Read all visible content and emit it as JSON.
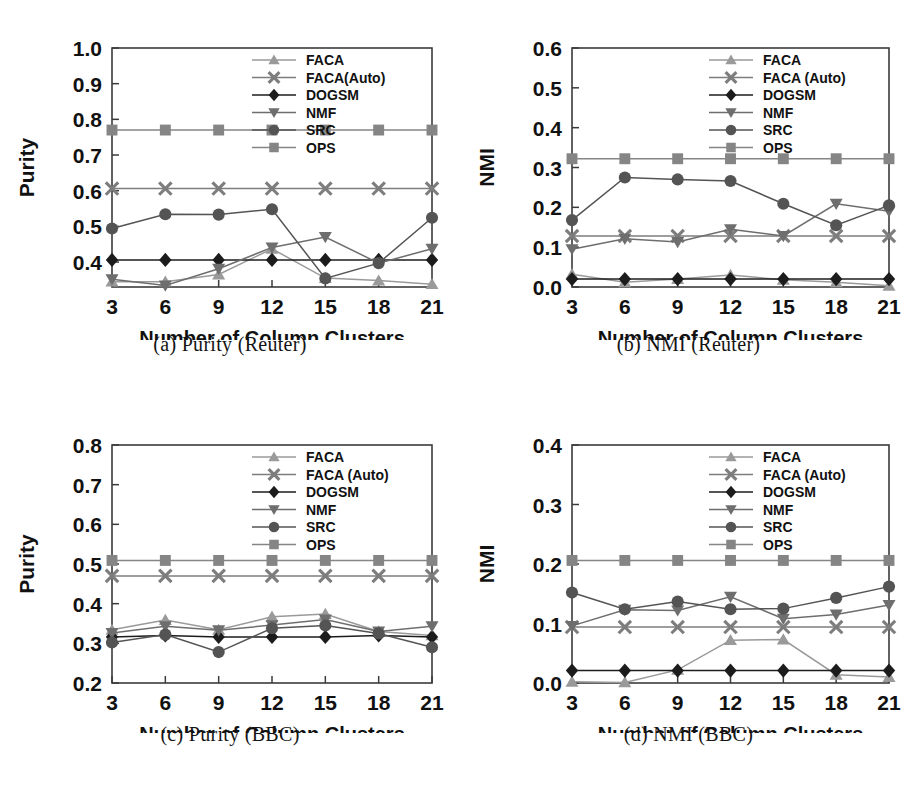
{
  "figure": {
    "x_axis_title": "Number of Column Clusters",
    "x_ticks": [
      "3",
      "6",
      "9",
      "12",
      "15",
      "18",
      "21"
    ],
    "series_names": [
      "FACA",
      "FACA (Auto)",
      "DOGSM",
      "NMF",
      "SRC",
      "OPS"
    ],
    "series_markers": [
      "triangle-up-marker",
      "cross-x-marker",
      "diamond-marker",
      "triangle-down-marker",
      "circle-marker",
      "square-marker"
    ],
    "series_colors": [
      "#9a9a9a",
      "#7d7d7d",
      "#1c1c1c",
      "#6e6e6e",
      "#545454",
      "#858585"
    ]
  },
  "panels": [
    {
      "id": "panel-a",
      "caption": "(a) Purity (Reuter)",
      "ylabel": "Purity",
      "y_ticks": [
        "1.0",
        "0.9",
        "0.8",
        "0.7",
        "0.6",
        "0.5",
        "0.4"
      ],
      "legend_labels": [
        "FACA",
        "FACA(Auto)",
        "DOGSM",
        "NMF",
        "SRC",
        "OPS"
      ],
      "chart_data": {
        "type": "line",
        "title": "(a) Purity (Reuter)",
        "xlabel": "Number of Column Clusters",
        "ylabel": "Purity",
        "x": [
          3,
          6,
          9,
          12,
          15,
          18,
          21
        ],
        "xlim": [
          3,
          21
        ],
        "ylim": [
          0.33,
          1.0
        ],
        "ytick_values": [
          1.0,
          0.9,
          0.8,
          0.7,
          0.6,
          0.5,
          0.4
        ],
        "grid": false,
        "legend_position": "top-right",
        "series": [
          {
            "name": "FACA",
            "values": [
              0.345,
              0.345,
              0.365,
              0.437,
              0.355,
              0.348,
              0.338
            ]
          },
          {
            "name": "FACA(Auto)",
            "values": [
              0.606,
              0.606,
              0.606,
              0.606,
              0.606,
              0.606,
              0.606
            ]
          },
          {
            "name": "DOGSM",
            "values": [
              0.406,
              0.406,
              0.406,
              0.406,
              0.406,
              0.406,
              0.406
            ]
          },
          {
            "name": "NMF",
            "values": [
              0.352,
              0.334,
              0.381,
              0.441,
              0.47,
              0.397,
              0.437
            ]
          },
          {
            "name": "SRC",
            "values": [
              0.494,
              0.534,
              0.533,
              0.548,
              0.354,
              0.397,
              0.524
            ]
          },
          {
            "name": "OPS",
            "values": [
              0.77,
              0.77,
              0.77,
              0.77,
              0.77,
              0.77,
              0.77
            ]
          }
        ]
      }
    },
    {
      "id": "panel-b",
      "caption": "(b) NMI (Reuter)",
      "ylabel": "NMI",
      "y_ticks": [
        "0.6",
        "0.5",
        "0.4",
        "0.3",
        "0.2",
        "0.1",
        "0.0"
      ],
      "legend_labels": [
        "FACA",
        "FACA (Auto)",
        "DOGSM",
        "NMF",
        "SRC",
        "OPS"
      ],
      "chart_data": {
        "type": "line",
        "title": "(b) NMI (Reuter)",
        "xlabel": "Number of Column Clusters",
        "ylabel": "NMI",
        "x": [
          3,
          6,
          9,
          12,
          15,
          18,
          21
        ],
        "xlim": [
          3,
          21
        ],
        "ylim": [
          0.0,
          0.6
        ],
        "ytick_values": [
          0.6,
          0.5,
          0.4,
          0.3,
          0.2,
          0.1,
          0.0
        ],
        "grid": false,
        "legend_position": "top-right",
        "series": [
          {
            "name": "FACA",
            "values": [
              0.032,
              0.012,
              0.02,
              0.03,
              0.018,
              0.012,
              0.003
            ]
          },
          {
            "name": "FACA (Auto)",
            "values": [
              0.128,
              0.128,
              0.128,
              0.128,
              0.128,
              0.128,
              0.128
            ]
          },
          {
            "name": "DOGSM",
            "values": [
              0.02,
              0.02,
              0.02,
              0.02,
              0.02,
              0.02,
              0.02
            ]
          },
          {
            "name": "NMF",
            "values": [
              0.095,
              0.121,
              0.113,
              0.145,
              0.128,
              0.209,
              0.19
            ]
          },
          {
            "name": "SRC",
            "values": [
              0.168,
              0.275,
              0.27,
              0.266,
              0.209,
              0.155,
              0.205
            ]
          },
          {
            "name": "OPS",
            "values": [
              0.322,
              0.322,
              0.322,
              0.322,
              0.322,
              0.322,
              0.322
            ]
          }
        ]
      }
    },
    {
      "id": "panel-c",
      "caption": "(c) Purity (BBC)",
      "ylabel": "Purity",
      "y_ticks": [
        "0.8",
        "0.7",
        "0.6",
        "0.5",
        "0.4",
        "0.3",
        "0.2"
      ],
      "legend_labels": [
        "FACA",
        "FACA (Auto)",
        "DOGSM",
        "NMF",
        "SRC",
        "OPS"
      ],
      "chart_data": {
        "type": "line",
        "title": "(c) Purity (BBC)",
        "xlabel": "Number of Column Clusters",
        "ylabel": "Purity",
        "x": [
          3,
          6,
          9,
          12,
          15,
          18,
          21
        ],
        "xlim": [
          3,
          21
        ],
        "ylim": [
          0.2,
          0.8
        ],
        "ytick_values": [
          0.8,
          0.7,
          0.6,
          0.5,
          0.4,
          0.3,
          0.2
        ],
        "grid": false,
        "legend_position": "top-right",
        "series": [
          {
            "name": "FACA",
            "values": [
              0.334,
              0.359,
              0.334,
              0.367,
              0.374,
              0.33,
              0.32
            ]
          },
          {
            "name": "FACA (Auto)",
            "values": [
              0.47,
              0.47,
              0.47,
              0.47,
              0.47,
              0.47,
              0.47
            ]
          },
          {
            "name": "DOGSM",
            "values": [
              0.316,
              0.32,
              0.316,
              0.316,
              0.316,
              0.32,
              0.316
            ]
          },
          {
            "name": "NMF",
            "values": [
              0.326,
              0.343,
              0.333,
              0.346,
              0.36,
              0.33,
              0.343
            ]
          },
          {
            "name": "SRC",
            "values": [
              0.302,
              0.322,
              0.278,
              0.338,
              0.345,
              0.325,
              0.29
            ]
          },
          {
            "name": "OPS",
            "values": [
              0.509,
              0.509,
              0.509,
              0.509,
              0.509,
              0.509,
              0.509
            ]
          }
        ]
      }
    },
    {
      "id": "panel-d",
      "caption": "(d) NMI (BBC)",
      "ylabel": "NMI",
      "y_ticks": [
        "0.4",
        "0.3",
        "0.2",
        "0.1",
        "0.0"
      ],
      "legend_labels": [
        "FACA",
        "FACA (Auto)",
        "DOGSM",
        "NMF",
        "SRC",
        "OPS"
      ],
      "chart_data": {
        "type": "line",
        "title": "(d) NMI (BBC)",
        "xlabel": "Number of Column Clusters",
        "ylabel": "NMI",
        "x": [
          3,
          6,
          9,
          12,
          15,
          18,
          21
        ],
        "xlim": [
          3,
          21
        ],
        "ylim": [
          0.0,
          0.4
        ],
        "ytick_values": [
          0.4,
          0.3,
          0.2,
          0.1,
          0.0
        ],
        "grid": false,
        "legend_position": "top-right",
        "series": [
          {
            "name": "FACA",
            "values": [
              0.002,
              0.001,
              0.022,
              0.072,
              0.073,
              0.014,
              0.01
            ]
          },
          {
            "name": "FACA (Auto)",
            "values": [
              0.094,
              0.094,
              0.094,
              0.094,
              0.094,
              0.094,
              0.094
            ]
          },
          {
            "name": "DOGSM",
            "values": [
              0.021,
              0.021,
              0.021,
              0.021,
              0.021,
              0.021,
              0.021
            ]
          },
          {
            "name": "NMF",
            "values": [
              0.096,
              0.123,
              0.122,
              0.145,
              0.108,
              0.115,
              0.131
            ]
          },
          {
            "name": "SRC",
            "values": [
              0.152,
              0.124,
              0.137,
              0.124,
              0.125,
              0.143,
              0.162
            ]
          },
          {
            "name": "OPS",
            "values": [
              0.206,
              0.206,
              0.206,
              0.206,
              0.206,
              0.206,
              0.206
            ]
          }
        ]
      }
    }
  ]
}
